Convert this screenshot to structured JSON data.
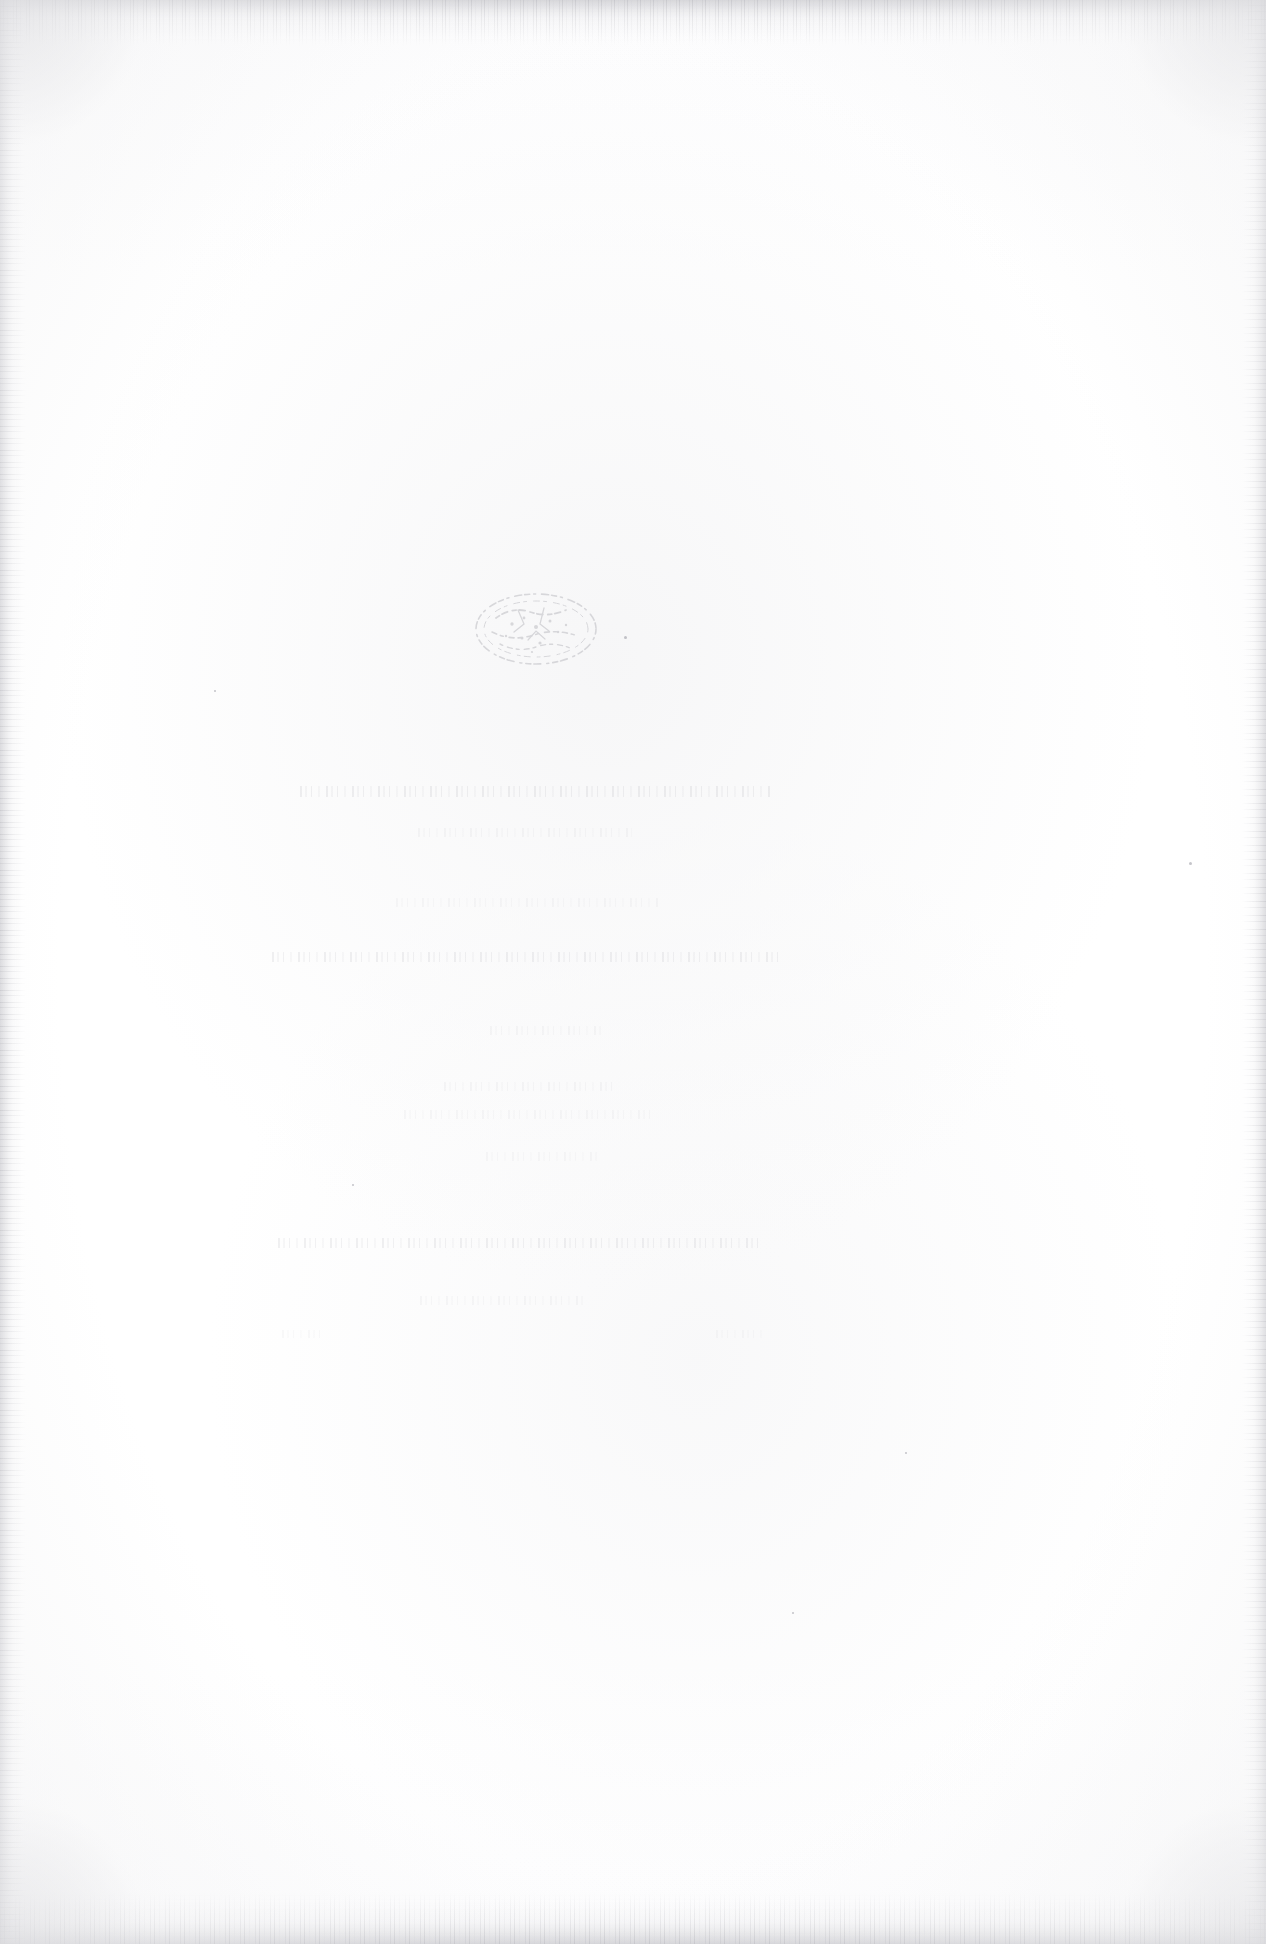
{
  "document": {
    "kind": "scanned-book-page",
    "appearance": "blank",
    "description": "Scanned page from an old printed book. The sheet is essentially blank: no legible text remains. A faded oval printer's device sits near the upper middle of the text block, and several horizontal bands of ghosted, illegible type show faintly through the paper.",
    "page_width_px": 1266,
    "page_height_px": 1944,
    "orientation": "portrait",
    "paper_color": "#fdfdfd",
    "ink_color": "#a8a8b0",
    "edge_noise_color": "#b6b6bc"
  },
  "emblem": {
    "name": "printers-device",
    "shape": "oval",
    "legible": false,
    "note": "Faded elliptical stamp or publisher's device; interior ornament is not readable.",
    "left_px": 466,
    "top_px": 580,
    "width_px": 140,
    "height_px": 98,
    "opacity": 0.3
  },
  "ghost_text": {
    "legible": false,
    "note": "Residual horizontal bands of type, too faded to read. Likely show-through from the reverse of the leaf.",
    "lines": [
      {
        "id": "ghost-a",
        "left_px": 300,
        "top_px": 786,
        "width_px": 470,
        "opacity": 0.32,
        "strength": "strongest"
      },
      {
        "id": "ghost-b",
        "left_px": 418,
        "top_px": 828,
        "width_px": 214,
        "opacity": 0.17,
        "strength": "faint"
      },
      {
        "id": "ghost-c",
        "left_px": 396,
        "top_px": 898,
        "width_px": 264,
        "opacity": 0.15,
        "strength": "faint"
      },
      {
        "id": "ghost-d",
        "left_px": 272,
        "top_px": 952,
        "width_px": 512,
        "opacity": 0.3,
        "strength": "strong"
      },
      {
        "id": "ghost-e",
        "left_px": 490,
        "top_px": 1026,
        "width_px": 112,
        "opacity": 0.16,
        "strength": "faint"
      },
      {
        "id": "ghost-f",
        "left_px": 444,
        "top_px": 1082,
        "width_px": 170,
        "opacity": 0.17,
        "strength": "faint"
      },
      {
        "id": "ghost-g",
        "left_px": 404,
        "top_px": 1110,
        "width_px": 252,
        "opacity": 0.15,
        "strength": "faint"
      },
      {
        "id": "ghost-h",
        "left_px": 486,
        "top_px": 1152,
        "width_px": 112,
        "opacity": 0.14,
        "strength": "very faint"
      },
      {
        "id": "ghost-i",
        "left_px": 278,
        "top_px": 1238,
        "width_px": 486,
        "opacity": 0.3,
        "strength": "strong"
      },
      {
        "id": "ghost-j",
        "left_px": 420,
        "top_px": 1296,
        "width_px": 164,
        "opacity": 0.16,
        "strength": "faint"
      },
      {
        "id": "ghost-k",
        "left_px": 282,
        "top_px": 1330,
        "width_px": 44,
        "opacity": 0.13,
        "strength": "very faint"
      },
      {
        "id": "ghost-l",
        "left_px": 716,
        "top_px": 1330,
        "width_px": 46,
        "opacity": 0.13,
        "strength": "very faint"
      }
    ]
  },
  "scan_edges": {
    "note": "Dark speckled scanning artifacts along all four borders, heaviest along the top and bottom.",
    "top_px": 46,
    "bottom_px": 52,
    "left_px": 26,
    "right_px": 24
  },
  "specks": [
    {
      "left_px": 1189,
      "top_px": 862,
      "size_px": 3
    },
    {
      "left_px": 624,
      "top_px": 636,
      "size_px": 3
    },
    {
      "left_px": 352,
      "top_px": 1184,
      "size_px": 2
    },
    {
      "left_px": 905,
      "top_px": 1452,
      "size_px": 2
    },
    {
      "left_px": 214,
      "top_px": 690,
      "size_px": 2
    },
    {
      "left_px": 792,
      "top_px": 1612,
      "size_px": 2
    }
  ]
}
